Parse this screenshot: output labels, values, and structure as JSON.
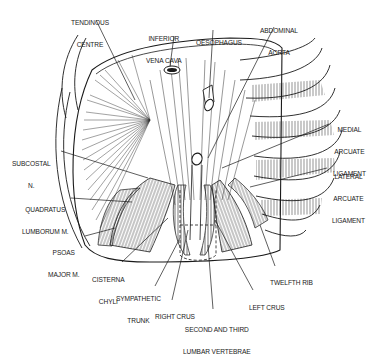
{
  "figure": {
    "ink_color": "#1a1a1a",
    "background": "#ffffff",
    "labels": [
      {
        "id": "tendinous-centre",
        "lines": [
          "TENDINOUS",
          "CENTRE"
        ]
      },
      {
        "id": "inferior-vena-cava",
        "lines": [
          "INFERIOR",
          "VENA CAVA"
        ]
      },
      {
        "id": "oesophagus",
        "lines": [
          "OESOPHAGUS"
        ]
      },
      {
        "id": "abdominal-aorta",
        "lines": [
          "ABDOMINAL",
          "AORTA"
        ]
      },
      {
        "id": "medial-arcuate-ligament",
        "lines": [
          "MEDIAL",
          "ARCUATE",
          "LIGAMENT"
        ]
      },
      {
        "id": "lateral-arcuate-ligament",
        "lines": [
          "LATERAL",
          "ARCUATE",
          "LIGAMENT"
        ]
      },
      {
        "id": "subcostal-n",
        "lines": [
          "SUBCOSTAL",
          "N."
        ]
      },
      {
        "id": "quadratus-lumborum",
        "lines": [
          "QUADRATUS",
          "LUMBORUM M."
        ]
      },
      {
        "id": "psoas-major",
        "lines": [
          "PSOAS",
          "MAJOR M."
        ]
      },
      {
        "id": "cisterna-chyli",
        "lines": [
          "CISTERNA",
          "CHYLI"
        ]
      },
      {
        "id": "sympathetic-trunk",
        "lines": [
          "SYMPATHETIC",
          "TRUNK"
        ]
      },
      {
        "id": "right-crus",
        "lines": [
          "RIGHT CRUS"
        ]
      },
      {
        "id": "second-third-lumbar-vertebrae",
        "lines": [
          "SECOND AND THIRD",
          "LUMBAR VERTEBRAE"
        ]
      },
      {
        "id": "left-crus",
        "lines": [
          "LEFT CRUS"
        ]
      },
      {
        "id": "twelfth-rib",
        "lines": [
          "TWELFTH RIB"
        ]
      }
    ]
  }
}
